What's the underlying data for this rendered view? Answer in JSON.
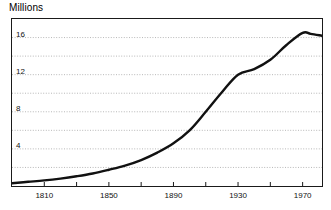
{
  "chart_data": {
    "type": "line",
    "title": "Millions",
    "xlabel": "",
    "ylabel": "Millions",
    "xlim": [
      1790,
      1982
    ],
    "ylim": [
      0,
      18
    ],
    "grid": true,
    "grid_style": "dotted-horizontal",
    "legend": "none",
    "y_ticks_labeled": [
      4,
      8,
      12,
      16
    ],
    "y_gridlines": [
      2,
      4,
      6,
      8,
      10,
      12,
      14,
      16
    ],
    "y_tick_labels": [
      "4",
      "8",
      "12",
      "16"
    ],
    "x_ticks_labeled": [
      1810,
      1850,
      1890,
      1930,
      1970
    ],
    "x_tick_labels": [
      "1810",
      "1850",
      "1890",
      "1930",
      "1970"
    ],
    "x_ticks_minor": [
      1790,
      1830,
      1870,
      1910,
      1950
    ],
    "series": [
      {
        "name": "Population",
        "color": "#111111",
        "x": [
          1790,
          1800,
          1810,
          1820,
          1830,
          1840,
          1850,
          1860,
          1870,
          1880,
          1890,
          1900,
          1910,
          1920,
          1930,
          1940,
          1950,
          1960,
          1970,
          1975,
          1982
        ],
        "values": [
          0.3,
          0.45,
          0.6,
          0.8,
          1.05,
          1.35,
          1.75,
          2.2,
          2.8,
          3.6,
          4.6,
          6.0,
          8.0,
          10.1,
          12.0,
          12.6,
          13.6,
          15.2,
          16.5,
          16.4,
          16.2
        ]
      }
    ]
  },
  "axis_labels": {
    "y": [
      "16",
      "12",
      "8",
      "4"
    ],
    "x": [
      "1810",
      "1850",
      "1890",
      "1930",
      "1970"
    ]
  }
}
